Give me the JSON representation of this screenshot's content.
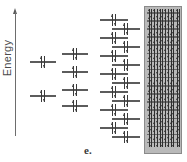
{
  "figure": {
    "caption": "e.",
    "background_color": "#ffffff",
    "line_color": "#5c5c5c",
    "arrow_color": "#3a3a3a",
    "band_fill_color": "#b9b9b9",
    "band_border_color": "#8a8a8a"
  },
  "axis": {
    "label": "Energy",
    "direction": "up",
    "orientation": "vertical",
    "left_px": 14,
    "top_px": 8,
    "height_px": 128
  },
  "chart_data": {
    "type": "diagram",
    "xlabel": "",
    "ylabel": "Energy",
    "grid": false,
    "legend": null,
    "annotations": [
      "e."
    ],
    "groups": [
      {
        "name": "two-level-group",
        "level_count": 2,
        "occupancy": "paired",
        "levels": [
          {
            "y_px": 58,
            "x_px": 30,
            "width_px": 26,
            "electrons": 2
          },
          {
            "y_px": 92,
            "x_px": 30,
            "width_px": 26,
            "electrons": 2
          }
        ]
      },
      {
        "name": "four-level-group",
        "level_count": 4,
        "occupancy": "paired",
        "levels": [
          {
            "y_px": 50,
            "x_px": 62,
            "width_px": 26,
            "electrons": 2
          },
          {
            "y_px": 68,
            "x_px": 62,
            "width_px": 26,
            "electrons": 2
          },
          {
            "y_px": 86,
            "x_px": 62,
            "width_px": 26,
            "electrons": 2
          },
          {
            "y_px": 102,
            "x_px": 62,
            "width_px": 26,
            "electrons": 2
          }
        ]
      },
      {
        "name": "many-level-group",
        "level_count": 14,
        "occupancy": "paired",
        "stagger": "alternating-left-right",
        "top_px": 16,
        "spacing_px": 9,
        "left_col_x_px": 100,
        "right_col_x_px": 112,
        "level_width_px": 28
      },
      {
        "name": "continuum-band",
        "level_count": 17,
        "arrows_per_row": 6,
        "occupancy": "paired",
        "shaded": true,
        "left_px": 144,
        "top_px": 6,
        "width_px": 38,
        "height_px": 148
      }
    ]
  }
}
